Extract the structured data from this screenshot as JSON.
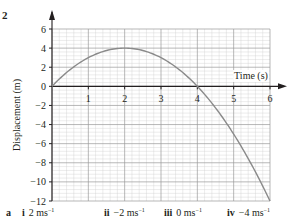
{
  "question_number": "2",
  "chart_data": {
    "type": "line",
    "title": "",
    "xlabel": "Time (s)",
    "ylabel": "Displacement (m)",
    "xlim": [
      0,
      6
    ],
    "ylim": [
      -12,
      6
    ],
    "x_ticks": [
      1,
      2,
      3,
      4,
      5,
      6
    ],
    "y_ticks": [
      6,
      4,
      2,
      0,
      -2,
      -4,
      -6,
      -8,
      -10,
      -12
    ],
    "grid": true,
    "legend": "none",
    "series": [
      {
        "name": "displacement",
        "equation": "s = 4t - t^2",
        "x": [
          0,
          0.5,
          1,
          1.5,
          2,
          2.5,
          3,
          3.5,
          4,
          4.5,
          5,
          5.5,
          6
        ],
        "y": [
          0,
          1.75,
          3,
          3.75,
          4,
          3.75,
          3,
          1.75,
          0,
          -2.25,
          -5,
          -8.25,
          -12
        ]
      }
    ]
  },
  "answers": {
    "part": "a",
    "items": [
      {
        "label": "i",
        "value": "2 ms",
        "sup": "−1"
      },
      {
        "label": "ii",
        "value": "−2 ms",
        "sup": "−1"
      },
      {
        "label": "iii",
        "value": "0 ms",
        "sup": "−1"
      },
      {
        "label": "iv",
        "value": "−4 ms",
        "sup": "−1"
      }
    ]
  },
  "colors": {
    "curve": "#8a8a8a",
    "grid_major": "#9a9a9a",
    "grid_minor": "#d0d0d0",
    "axis": "#231f20",
    "text": "#231f20"
  }
}
